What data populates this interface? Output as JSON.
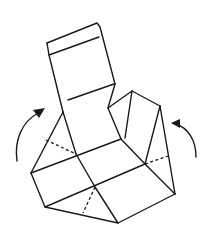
{
  "diagram": {
    "type": "origami-fold-step",
    "colors": {
      "line": "#1a1a1a",
      "background": "#ffffff"
    },
    "elements": [
      {
        "name": "tall-back-panel",
        "kind": "solid-outline"
      },
      {
        "name": "left-triangle-flap",
        "kind": "solid-outline-with-dashed-crease"
      },
      {
        "name": "right-triangle-flap",
        "kind": "solid-outline-with-dashed-crease"
      },
      {
        "name": "base-grid",
        "kind": "solid-outline-with-dashed-crease"
      },
      {
        "name": "left-fold-arrow",
        "kind": "curved-arrow",
        "direction": "up-clockwise"
      },
      {
        "name": "right-fold-arrow",
        "kind": "curved-arrow",
        "direction": "up-counterclockwise"
      }
    ]
  }
}
